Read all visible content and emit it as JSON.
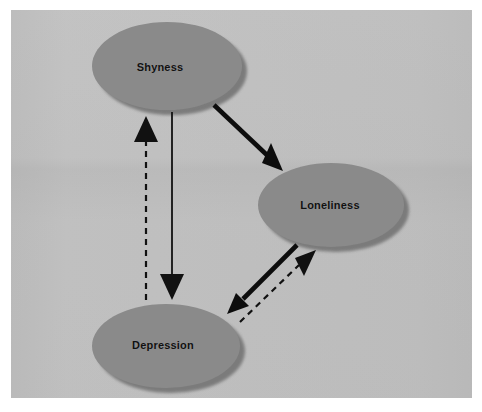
{
  "figure": {
    "background_color": "#ffffff",
    "panel_color": "#e8e8e8"
  },
  "nodes": [
    {
      "id": "shyness",
      "label": "Shyness",
      "cx": 167,
      "cy": 66,
      "rx": 75,
      "ry": 44,
      "label_x": 160,
      "label_y": 67,
      "fill": "#8a8a8a",
      "shadow": "#6f6f6f"
    },
    {
      "id": "loneliness",
      "label": "Loneliness",
      "cx": 331,
      "cy": 205,
      "rx": 73,
      "ry": 42,
      "label_x": 330,
      "label_y": 205,
      "fill": "#8a8a8a",
      "shadow": "#6f6f6f"
    },
    {
      "id": "depression",
      "label": "Depression",
      "cx": 166,
      "cy": 346,
      "rx": 74,
      "ry": 42,
      "label_x": 163,
      "label_y": 345,
      "fill": "#8a8a8a",
      "shadow": "#6f6f6f"
    }
  ],
  "edges": [
    {
      "id": "shyness-to-depression",
      "from": "shyness",
      "to": "depression",
      "style": "solid",
      "weight": "thin",
      "direction": "down",
      "color": "#111111",
      "stroke_width": 1.8,
      "x1": 172,
      "y1": 112,
      "x2": 172,
      "y2": 290
    },
    {
      "id": "depression-to-shyness",
      "from": "depression",
      "to": "shyness",
      "style": "dashed",
      "weight": "thin",
      "direction": "up",
      "color": "#111111",
      "stroke_width": 2.2,
      "dash": "6 5",
      "x1": 146,
      "y1": 300,
      "x2": 146,
      "y2": 128
    },
    {
      "id": "shyness-to-loneliness",
      "from": "shyness",
      "to": "loneliness",
      "style": "solid",
      "weight": "thick",
      "direction": "down-right",
      "color": "#0d0d0d",
      "stroke_width": 4.4,
      "x1": 214,
      "y1": 105,
      "x2": 276,
      "y2": 164
    },
    {
      "id": "loneliness-to-depression",
      "from": "loneliness",
      "to": "depression",
      "style": "solid",
      "weight": "thick",
      "direction": "down-left",
      "color": "#0d0d0d",
      "stroke_width": 4.4,
      "x1": 297,
      "y1": 245,
      "x2": 233,
      "y2": 309
    },
    {
      "id": "depression-to-loneliness",
      "from": "depression",
      "to": "loneliness",
      "style": "dashed",
      "weight": "thin",
      "direction": "up-right",
      "color": "#111111",
      "stroke_width": 2.2,
      "dash": "6 5",
      "x1": 240,
      "y1": 322,
      "x2": 308,
      "y2": 256
    }
  ]
}
